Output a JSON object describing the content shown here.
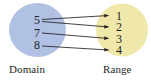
{
  "figure": {
    "type": "mapping-diagram",
    "background_color": "#ffffff",
    "domain": {
      "label": "Domain",
      "fill_color": "#b0c1e3",
      "elements": [
        {
          "value": "5"
        },
        {
          "value": "7"
        },
        {
          "value": "8"
        }
      ]
    },
    "range": {
      "label": "Range",
      "fill_color": "#f0e7ab",
      "elements": [
        {
          "value": "1"
        },
        {
          "value": "2"
        },
        {
          "value": "3"
        },
        {
          "value": "4"
        }
      ]
    },
    "arrows": [
      {
        "from": "5",
        "to": "1"
      },
      {
        "from": "5",
        "to": "2"
      },
      {
        "from": "7",
        "to": "3"
      },
      {
        "from": "8",
        "to": "4"
      }
    ],
    "arrow_color": "#231f20",
    "text_color": "#231f20"
  }
}
